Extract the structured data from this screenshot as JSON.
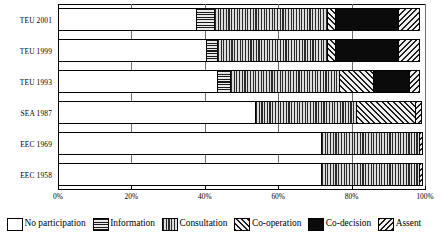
{
  "chart_data": {
    "type": "bar",
    "orientation": "horizontal",
    "stacked": true,
    "stack_mode": "percent",
    "title": "",
    "xlabel": "",
    "ylabel": "",
    "xlim": [
      0,
      100
    ],
    "grid": true,
    "legend_position": "bottom",
    "xticks": [
      "0%",
      "20%",
      "40%",
      "60%",
      "80%",
      "100%"
    ],
    "xtick_values": [
      0,
      20,
      40,
      60,
      80,
      100
    ],
    "categories": [
      "TEU 2001",
      "TEU 1999",
      "TEU 1993",
      "SEA 1987",
      "EEC 1969",
      "EEC 1958"
    ],
    "series": [
      {
        "name": "No participation",
        "pattern": "solid-white",
        "values": [
          38.0,
          40.5,
          43.5,
          54.0,
          72.0,
          72.0
        ]
      },
      {
        "name": "Information",
        "pattern": "horizontal-lines",
        "values": [
          5.0,
          3.5,
          4.0,
          0.0,
          0.0,
          0.0
        ]
      },
      {
        "name": "Consultation",
        "pattern": "vertical-lines",
        "values": [
          31.0,
          30.0,
          30.0,
          27.7,
          27.0,
          27.0
        ]
      },
      {
        "name": "Co-operation",
        "pattern": "diagonal-hatch-right",
        "values": [
          2.5,
          2.5,
          9.5,
          16.3,
          0.0,
          0.0
        ]
      },
      {
        "name": "Co-decision",
        "pattern": "solid-black",
        "values": [
          17.5,
          17.5,
          10.0,
          0.0,
          0.0,
          0.0
        ]
      },
      {
        "name": "Assent",
        "pattern": "diagonal-hatch-left",
        "values": [
          6.0,
          6.0,
          3.0,
          2.0,
          1.0,
          1.0
        ]
      }
    ]
  },
  "legend": {
    "items": [
      {
        "label": "No participation",
        "pattern": "solid-white"
      },
      {
        "label": "Information",
        "pattern": "horizontal-lines"
      },
      {
        "label": "Consultation",
        "pattern": "vertical-lines"
      },
      {
        "label": "Co-operation",
        "pattern": "diagonal-hatch-right"
      },
      {
        "label": "Co-decision",
        "pattern": "solid-black"
      },
      {
        "label": "Assent",
        "pattern": "diagonal-hatch-left"
      }
    ]
  },
  "colors": {
    "axis": "#000000",
    "grid": "#6d6d6d",
    "background": "#ffffff",
    "co_decision_fill": "#0b0b0b"
  }
}
